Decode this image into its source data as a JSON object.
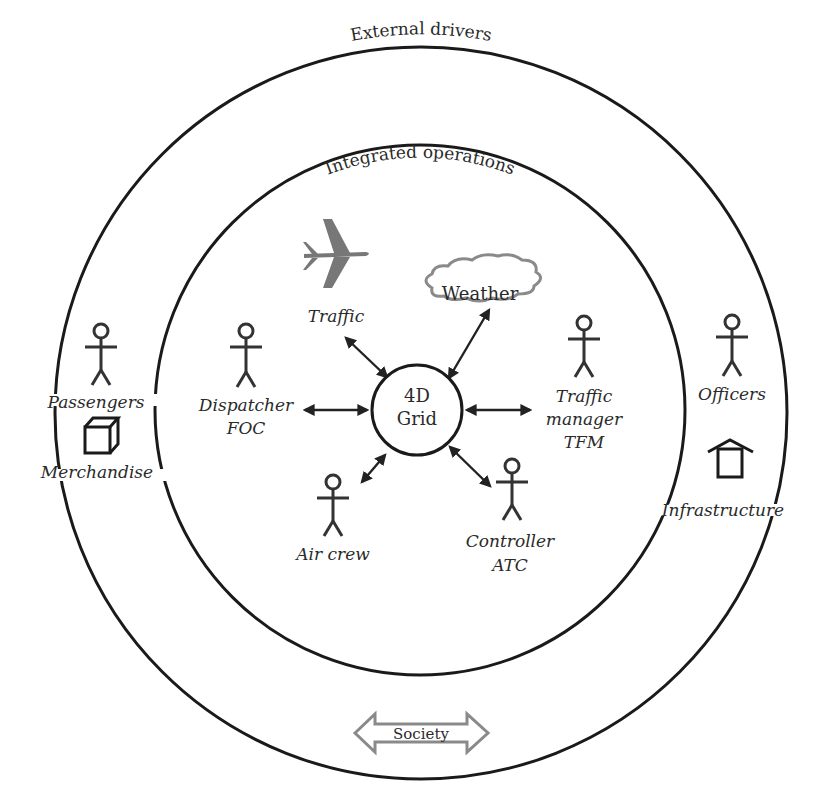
{
  "diagram": {
    "outer_ring": {
      "label": "External drivers",
      "cx": 421,
      "cy": 413,
      "r": 366
    },
    "inner_ring": {
      "label": "Integrated operations",
      "cx": 420,
      "cy": 410,
      "r": 265
    },
    "hub": {
      "line1": "4D",
      "line2": "Grid",
      "cx": 417,
      "cy": 410,
      "r": 45
    },
    "inner_nodes": [
      {
        "id": "traffic",
        "icon": "airplane-icon",
        "label": "Traffic"
      },
      {
        "id": "weather",
        "icon": "cloud-icon",
        "label": "Weather"
      },
      {
        "id": "dispatcher",
        "icon": "person-icon",
        "line1": "Dispatcher",
        "line2": "FOC"
      },
      {
        "id": "traffic-manager",
        "icon": "person-icon",
        "line1": "Traffic",
        "line2": "manager",
        "line3": "TFM"
      },
      {
        "id": "air-crew",
        "icon": "person-icon",
        "label": "Air crew"
      },
      {
        "id": "controller",
        "icon": "person-icon",
        "line1": "Controller",
        "line2": "ATC"
      }
    ],
    "outer_nodes": [
      {
        "id": "passengers",
        "icon": "person-icon",
        "label": "Passengers"
      },
      {
        "id": "merchandise",
        "icon": "box-icon",
        "label": "Merchandise"
      },
      {
        "id": "officers",
        "icon": "person-icon",
        "label": "Officers"
      },
      {
        "id": "infrastructure",
        "icon": "house-icon",
        "label": "Infrastructure"
      },
      {
        "id": "society",
        "icon": "double-arrow-icon",
        "label": "Society"
      }
    ],
    "colors": {
      "line": "#1a1a1a",
      "text": "#2a2a2a",
      "icon_gray": "#777777",
      "outline_gray": "#8a8a8a"
    }
  }
}
